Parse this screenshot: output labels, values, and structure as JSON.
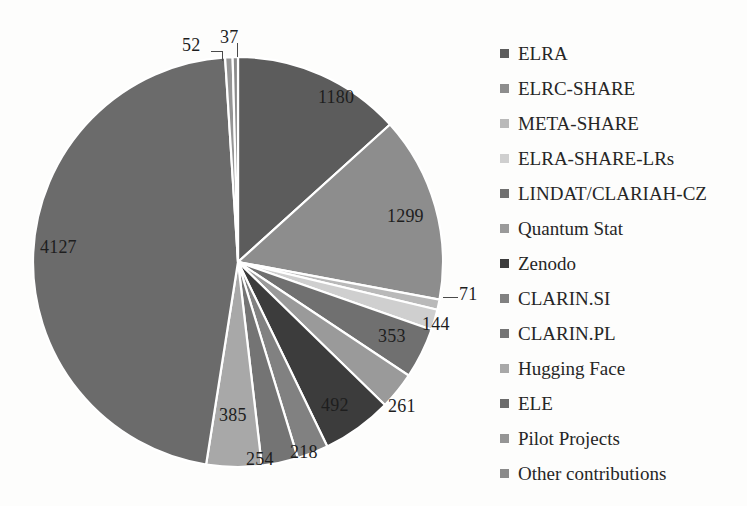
{
  "chart_data": {
    "type": "pie",
    "title": "",
    "total": 10772,
    "categories": [
      "ELRA",
      "ELRC-SHARE",
      "META-SHARE",
      "ELRA-SHARE-LRs",
      "LINDAT/CLARIAH-CZ",
      "Quantum Stat",
      "Zenodo",
      "CLARIN.SI",
      "CLARIN.PL",
      "Hugging Face",
      "ELE",
      "Pilot Projects",
      "Other contributions"
    ],
    "values": [
      1180,
      1299,
      71,
      144,
      353,
      261,
      492,
      218,
      254,
      385,
      4127,
      52,
      37
    ],
    "colors": [
      "#5c5c5c",
      "#8d8d8d",
      "#b9b9b9",
      "#cfcfcf",
      "#707070",
      "#9a9a9a",
      "#3c3c3c",
      "#818181",
      "#747474",
      "#a8a8a8",
      "#6b6b6b",
      "#959595",
      "#8a8a8a"
    ],
    "labels_shown": [
      "1180",
      "1299",
      "71",
      "144",
      "353",
      "261",
      "492",
      "218",
      "254",
      "385",
      "4127",
      "52",
      "37"
    ],
    "legend_position": "right",
    "grid": false,
    "xlabel": "",
    "ylabel": ""
  },
  "legend": {
    "items": [
      {
        "label": "ELRA",
        "color": "#5c5c5c"
      },
      {
        "label": "ELRC-SHARE",
        "color": "#8d8d8d"
      },
      {
        "label": "META-SHARE",
        "color": "#b9b9b9"
      },
      {
        "label": "ELRA-SHARE-LRs",
        "color": "#cfcfcf"
      },
      {
        "label": "LINDAT/CLARIAH-CZ",
        "color": "#707070"
      },
      {
        "label": "Quantum Stat",
        "color": "#9a9a9a"
      },
      {
        "label": "Zenodo",
        "color": "#3c3c3c"
      },
      {
        "label": "CLARIN.SI",
        "color": "#818181"
      },
      {
        "label": "CLARIN.PL",
        "color": "#747474"
      },
      {
        "label": "Hugging Face",
        "color": "#a8a8a8"
      },
      {
        "label": "ELE",
        "color": "#6b6b6b"
      },
      {
        "label": "Pilot Projects",
        "color": "#959595"
      },
      {
        "label": "Other contributions",
        "color": "#8a8a8a"
      }
    ]
  },
  "slice_labels": {
    "elra": "1180",
    "elrc_share": "1299",
    "meta_share": "71",
    "elra_share_lrs": "144",
    "lindat": "353",
    "quantum_stat": "261",
    "zenodo": "492",
    "clarin_si": "218",
    "clarin_pl": "254",
    "hugging_face": "385",
    "ele": "4127",
    "pilot_projects": "52",
    "other_contributions": "37"
  }
}
